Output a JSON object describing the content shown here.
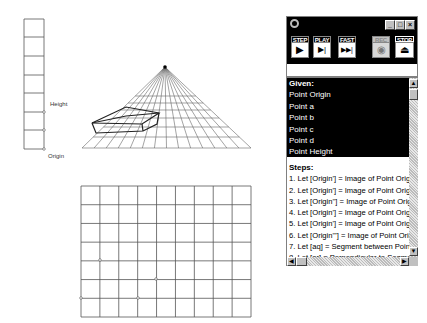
{
  "drawing": {
    "height_column": {
      "x": 24,
      "width": 20,
      "rows_y": [
        19,
        37,
        56,
        75,
        93,
        112,
        130,
        149
      ],
      "points_y": [
        112,
        130,
        149
      ],
      "labels": {
        "height": "Height",
        "origin": "Origin"
      }
    },
    "perspective_grid": {
      "apex": [
        165,
        67
      ],
      "base_y": 148,
      "base_left": 82,
      "base_right": 251,
      "ray_count": 15,
      "horizontals_y": [
        96,
        103,
        110,
        118,
        127,
        137,
        148
      ],
      "box": {
        "top": [
          [
            92,
            123
          ],
          [
            126,
            107
          ],
          [
            159,
            113
          ],
          [
            142,
            124
          ]
        ],
        "bottom": [
          [
            96,
            133
          ],
          [
            143,
            131
          ],
          [
            157,
            124
          ]
        ],
        "inner": [
          [
            92,
            123
          ],
          [
            126,
            116
          ],
          [
            159,
            113
          ]
        ]
      }
    },
    "flat_grid": {
      "left": 81,
      "top": 186,
      "right": 251,
      "bottom": 317,
      "cols": 9,
      "rows": 7,
      "points": [
        [
          100,
          260
        ],
        [
          156,
          279
        ],
        [
          81,
          298
        ],
        [
          138,
          298
        ]
      ]
    },
    "stroke_color": "#555555"
  },
  "panel": {
    "window_controls": {
      "minimize": "_",
      "maximize": "□",
      "close": "×"
    },
    "toolbar": [
      {
        "caption": "STEP",
        "glyph": "▶"
      },
      {
        "caption": "PLAY",
        "glyph": "▶|"
      },
      {
        "caption": "FAST",
        "glyph": "▶▶|"
      },
      {
        "caption": "REC",
        "glyph": "◉"
      },
      {
        "caption": "STOP",
        "glyph": "⏏"
      }
    ],
    "given": {
      "header": "Given:",
      "items": [
        "Point Origin",
        "Point a",
        "Point b",
        "Point c",
        "Point d",
        "Point Height"
      ]
    },
    "steps": {
      "header": "Steps:",
      "items": [
        "1. Let [Origin'] = Image of Point Origin",
        "2. Let [Origin'] = Image of Point Origin",
        "3. Let [Origin''] = Image of Point Origin",
        "4. Let [Origin'] = Image of Point Origin",
        "5. Let [Origin'] = Image of Point Origin",
        "6. Let [Origin'''] = Image of Point Origin",
        "7. Let [aq] = Segment between Points",
        "8. Let [ar] = Perpendicular to Segment"
      ]
    },
    "scroll": {
      "up": "▲",
      "down": "▼",
      "left": "◀",
      "right": "▶"
    }
  }
}
